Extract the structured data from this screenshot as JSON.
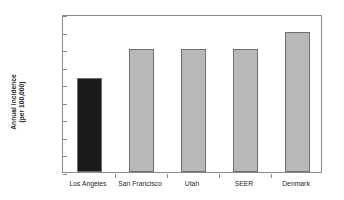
{
  "chart_data": {
    "type": "bar",
    "title": "",
    "xlabel": "",
    "ylabel": "Annual incidence (per 100,000)",
    "ylabel_line1": "Annual incidence",
    "ylabel_line2": "(per 100,000)",
    "categories": [
      "Los Angeles",
      "San Francisco",
      "Utah",
      "SEER",
      "Denmark"
    ],
    "values": [
      1.07,
      1.4,
      1.4,
      1.4,
      1.6
    ],
    "bar_colors": [
      "#1a1a1a",
      "#b8b8b8",
      "#b8b8b8",
      "#b8b8b8",
      "#b8b8b8"
    ],
    "bar_border_color": "#6f6f6f",
    "ylim": [
      0.0,
      1.8
    ],
    "ytick_step": 0.2,
    "ytick_labels": [
      "0.0",
      "0.2",
      "0.4",
      "0.6",
      "0.8",
      "1.0",
      "1.2",
      "1.4",
      "1.6",
      "1.8"
    ],
    "ytick_values": [
      0.0,
      0.2,
      0.4,
      0.6,
      0.8,
      1.0,
      1.2,
      1.4,
      1.6,
      1.8
    ],
    "grid": false,
    "legend": "none",
    "axis_color": "#8a8a8a",
    "plot_background": "#ffffff",
    "text_color": "#231f20"
  }
}
